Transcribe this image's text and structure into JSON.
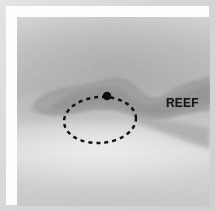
{
  "figure": {
    "kind": "grayscale-survey-image",
    "frame": {
      "mount_color": "#d6d6d6",
      "matte_color": "#fdfdfd",
      "plate_background": "#c4c4c4"
    },
    "labels": [
      {
        "id": "reef-label",
        "text": "REEF",
        "color": "#151515",
        "x": 149,
        "y": 79,
        "font_weight": "bold",
        "font_size_px": 13
      }
    ],
    "annotations": {
      "ellipse": {
        "name": "dashed-ellipse-annotation",
        "style": "dashed",
        "stroke_color": "#101010",
        "stroke_width": 2.4,
        "dash_pattern": "4 4",
        "center_x": 83,
        "center_y": 103,
        "radius_x": 36,
        "radius_y": 23,
        "rotation_deg": -4
      },
      "point_marker": {
        "name": "point-marker",
        "shape": "filled-circle",
        "fill_color": "#0c0c0c",
        "center_x": 90,
        "center_y": 79,
        "radius": 4.2
      }
    },
    "features": [
      {
        "id": "reef-mass",
        "name": "dark-reef-mass",
        "fill_color": "#9a9a9a",
        "description": "elongated dark seabed feature crossing the frame"
      },
      {
        "id": "reef-mass-shadow",
        "name": "reef-mass-shadow",
        "fill_color": "#8e8e8e",
        "description": "darker core of the reef feature"
      }
    ],
    "tones": {
      "background_light": "#d6d6d6",
      "background_mid": "#c0c0c0",
      "background_dark": "#b4b4b4",
      "feature_gray": "#9a9a9a",
      "ink_black": "#101010"
    }
  }
}
